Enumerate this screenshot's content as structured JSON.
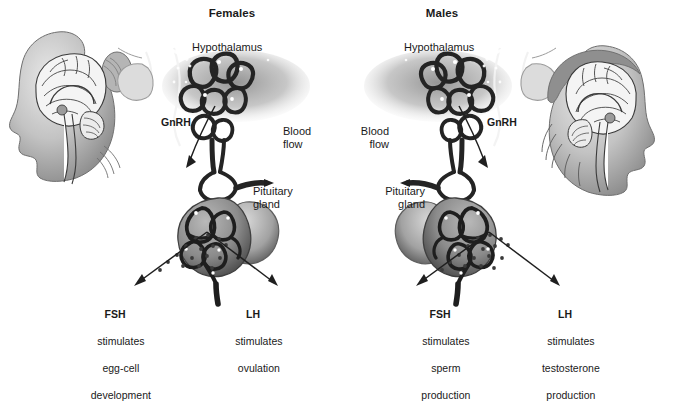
{
  "figure": {
    "kind": "anatomical-diagram",
    "background_color": "#ffffff",
    "ink_color": "#1a1a1a",
    "vessel_color": "#2b2b2b",
    "tissue_gray": "#9a9a9a"
  },
  "panels": [
    {
      "id": "females",
      "title": "Females",
      "head": {
        "name": "female-head-illustration",
        "facing": "left",
        "hair": "bun",
        "parts": [
          "brain",
          "corpus-callosum",
          "cerebellum",
          "brainstem"
        ]
      },
      "labels": {
        "hypothalamus": "Hypothalamus",
        "gnrh": "GnRH",
        "blood_flow": "Blood\nflow",
        "pituitary": "Pituitary\ngland"
      },
      "hormones": [
        {
          "abbr": "FSH",
          "lines": [
            "stimulates",
            "egg-cell",
            "development"
          ]
        },
        {
          "abbr": "LH",
          "lines": [
            "stimulates",
            "ovulation"
          ]
        }
      ]
    },
    {
      "id": "males",
      "title": "Males",
      "head": {
        "name": "male-head-illustration",
        "facing": "right",
        "hair": "short",
        "parts": [
          "brain",
          "corpus-callosum",
          "cerebellum",
          "brainstem"
        ]
      },
      "labels": {
        "hypothalamus": "Hypothalamus",
        "gnrh": "GnRH",
        "blood_flow": "Blood\nflow",
        "pituitary": "Pituitary\ngland"
      },
      "hormones": [
        {
          "abbr": "FSH",
          "lines": [
            "stimulates",
            "sperm",
            "production"
          ]
        },
        {
          "abbr": "LH",
          "lines": [
            "stimulates",
            "testosterone",
            "production"
          ]
        }
      ]
    }
  ],
  "flat": {
    "females_title": "Females",
    "males_title": "Males",
    "f_hypothalamus": "Hypothalamus",
    "f_gnrh": "GnRH",
    "f_blood_1": "Blood",
    "f_blood_2": "flow",
    "f_pit_1": "Pituitary",
    "f_pit_2": "gland",
    "f_fsh_abbr": "FSH",
    "f_fsh_l1": "stimulates",
    "f_fsh_l2": "egg-cell",
    "f_fsh_l3": "development",
    "f_lh_abbr": "LH",
    "f_lh_l1": "stimulates",
    "f_lh_l2": "ovulation",
    "m_hypothalamus": "Hypothalamus",
    "m_gnrh": "GnRH",
    "m_blood_1": "Blood",
    "m_blood_2": "flow",
    "m_pit_1": "Pituitary",
    "m_pit_2": "gland",
    "m_fsh_abbr": "FSH",
    "m_fsh_l1": "stimulates",
    "m_fsh_l2": "sperm",
    "m_fsh_l3": "production",
    "m_lh_abbr": "LH",
    "m_lh_l1": "stimulates",
    "m_lh_l2": "testosterone",
    "m_lh_l3": "production"
  }
}
